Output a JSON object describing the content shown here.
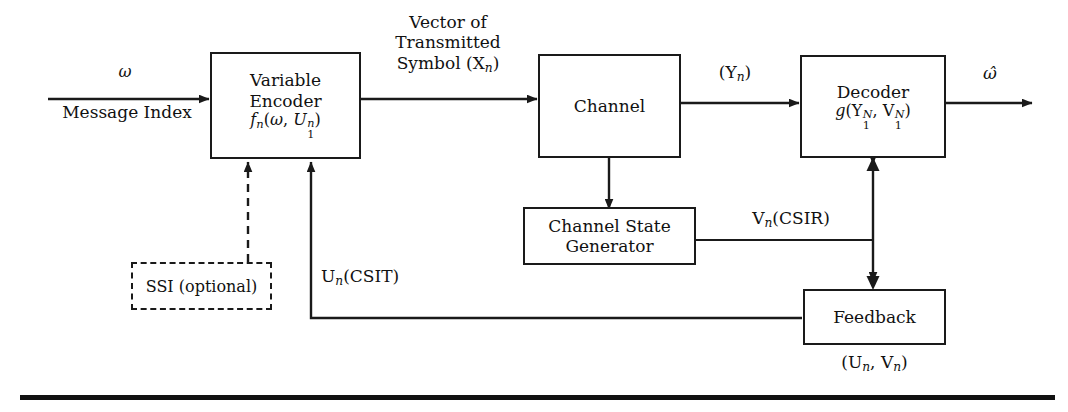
{
  "figure": {
    "type": "block-diagram",
    "blocks": [
      {
        "id": "encoder",
        "lines": [
          "Variable",
          "Encoder",
          "f_n(w, U_1^n)"
        ]
      },
      {
        "id": "channel",
        "lines": [
          "Channel"
        ]
      },
      {
        "id": "decoder",
        "lines": [
          "Decoder",
          "g(Y_1^N, V_1^N)"
        ]
      },
      {
        "id": "channel-state-generator",
        "lines": [
          "Channel State",
          "Generator"
        ]
      },
      {
        "id": "feedback",
        "lines": [
          "Feedback"
        ]
      },
      {
        "id": "ssi",
        "lines": [
          "SSI (optional)"
        ],
        "style": "dashed"
      }
    ],
    "labels": {
      "input_symbol": "ω",
      "input_caption": "Message Index",
      "transmitted_line1": "Vector of",
      "transmitted_line2": "Transmitted",
      "transmitted_line3": "Symbol (X",
      "transmitted_sub": "n",
      "transmitted_close": ")",
      "channel_out_open": "(Y",
      "channel_out_sub": "n",
      "channel_out_close": ")",
      "output_symbol": "ω̂",
      "csir_main": "V",
      "csir_sub": "n",
      "csir_paren": "(CSIR)",
      "csit_main": "U",
      "csit_sub": "n",
      "csit_paren": "(CSIT)",
      "feedback_pair_open": "(U",
      "feedback_pair_sub1": "n",
      "feedback_pair_mid": ", V",
      "feedback_pair_sub2": "n",
      "feedback_pair_close": ")",
      "ssi_text": "SSI (optional)"
    },
    "encoder": {
      "line1": "Variable",
      "line2": "Encoder",
      "fn_f": "f",
      "fn_sub": "n",
      "fn_open": "(",
      "fn_omega": "ω",
      "fn_comma": ", ",
      "fn_U": "U",
      "fn_U_sup": "n",
      "fn_U_sub": "1",
      "fn_close": ")"
    },
    "channel": {
      "label": "Channel"
    },
    "decoder": {
      "line1": "Decoder",
      "g": "g",
      "open": "(",
      "Y": "Y",
      "Y_sup": "N",
      "Y_sub": "1",
      "comma": ", ",
      "V": "V",
      "V_sup": "N",
      "V_sub": "1",
      "close": ")"
    },
    "state_generator": {
      "line1": "Channel State",
      "line2": "Generator"
    },
    "feedback_block": {
      "label": "Feedback"
    },
    "colors": {
      "line": "#1a1a1a",
      "text": "#111111",
      "background": "#ffffff",
      "rule": "#111111"
    }
  }
}
